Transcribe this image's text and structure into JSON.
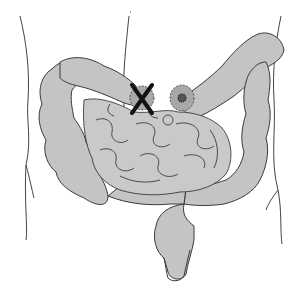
{
  "diagram": {
    "subject": "Abdominal intestines illustration",
    "regions": [
      {
        "id": "torso-outline",
        "label": "Torso outline"
      },
      {
        "id": "ascending-colon",
        "label": "Ascending colon"
      },
      {
        "id": "transverse-colon-right",
        "label": "Transverse colon (right segment)"
      },
      {
        "id": "transverse-colon-left",
        "label": "Transverse colon (left segment)"
      },
      {
        "id": "descending-colon",
        "label": "Descending colon"
      },
      {
        "id": "sigmoid-colon",
        "label": "Sigmoid colon"
      },
      {
        "id": "rectum",
        "label": "Rectum"
      },
      {
        "id": "small-intestine",
        "label": "Small intestine"
      }
    ],
    "markers": [
      {
        "id": "resection-marker",
        "symbol": "X",
        "label": "Removed / closed segment"
      },
      {
        "id": "stoma-marker",
        "symbol": "stoma",
        "label": "Stoma opening"
      }
    ],
    "colors": {
      "bowel_fill": "#c4c4c4",
      "bowel_stroke": "#3a3a3a",
      "marker_fill": "#a8a8a8",
      "x_mark": "#111111",
      "stoma_center": "#555555",
      "outline": "#444444",
      "background": "#ffffff"
    }
  }
}
